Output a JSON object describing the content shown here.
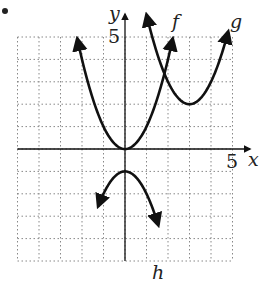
{
  "chart_data": {
    "type": "line",
    "title": "",
    "xlabel": "x",
    "ylabel": "y",
    "xlim": [
      -5,
      5
    ],
    "ylim": [
      -5,
      5
    ],
    "grid": true,
    "tick_labels": {
      "x": [
        "5"
      ],
      "y": [
        "5"
      ]
    },
    "series": [
      {
        "name": "f",
        "equation": "y = x^2",
        "vertex": [
          0,
          0
        ],
        "opens": "up"
      },
      {
        "name": "g",
        "equation": "y = (x-3)^2 + 2",
        "vertex": [
          3,
          2
        ],
        "opens": "up"
      },
      {
        "name": "h",
        "equation": "y = -x^2 - 1",
        "vertex": [
          0,
          -1
        ],
        "opens": "down"
      }
    ]
  },
  "labels": {
    "x_axis": "x",
    "y_axis": "y",
    "x_tick": "5",
    "y_tick": "5",
    "f": "f",
    "g": "g",
    "h": "h"
  }
}
